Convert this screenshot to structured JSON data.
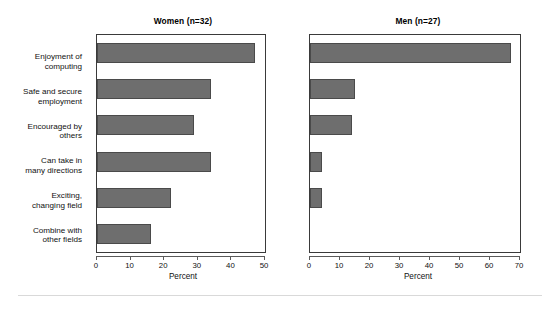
{
  "chart_data": {
    "type": "bar",
    "title": "",
    "orientation": "horizontal",
    "grid": false,
    "legend": false,
    "xlabel": "Percent",
    "ylabel": "",
    "categories": [
      "Enjoyment of computing",
      "Safe and secure employment",
      "Encouraged by others",
      "Can take in many directions",
      "Exciting, changing field",
      "Combine with other fields"
    ],
    "panels": [
      {
        "title": "Women (n=32)",
        "xlabel": "Percent",
        "xlim": [
          0,
          50
        ],
        "xticks": [
          0,
          10,
          20,
          30,
          40,
          50
        ],
        "xticklabels": [
          "0",
          "10",
          "20",
          "30",
          "40",
          "50"
        ],
        "values": [
          47,
          34,
          29,
          34,
          22,
          16
        ]
      },
      {
        "title": "Men (n=27)",
        "xlabel": "Percent",
        "xlim": [
          0,
          70
        ],
        "xticks": [
          0,
          10,
          20,
          30,
          40,
          50,
          60,
          70
        ],
        "xticklabels": [
          "0",
          "10",
          "20",
          "30",
          "40",
          "50",
          "60",
          "70"
        ],
        "values": [
          67,
          15,
          14,
          4,
          4,
          0
        ]
      }
    ],
    "colors": {
      "bar_fill": "#6e6e6e",
      "bar_edge": "#4a4a4a",
      "axis": "#3a3a3a",
      "text": "#111111",
      "background": "#ffffff"
    }
  },
  "category_lines": [
    [
      "Enjoyment of",
      "computing"
    ],
    [
      "Safe and secure",
      "employment"
    ],
    [
      "Encouraged by",
      "others"
    ],
    [
      "Can take in",
      "many directions"
    ],
    [
      "Exciting,",
      "changing field"
    ],
    [
      "Combine with",
      "other fields"
    ]
  ]
}
